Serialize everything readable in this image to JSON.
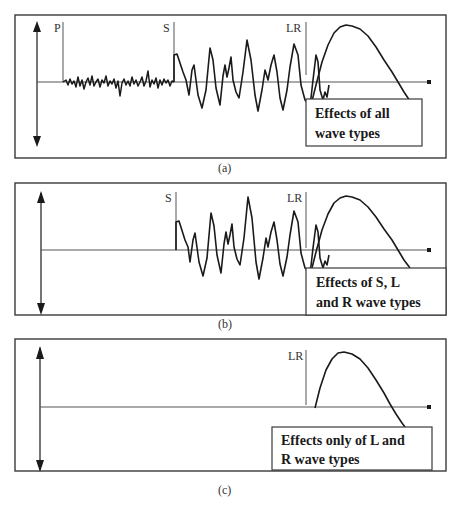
{
  "panels": [
    {
      "id": "a",
      "caption": "(a)",
      "markers": [
        "P",
        "S",
        "LR"
      ],
      "description_line1": "Effects of all",
      "description_line2": "wave types"
    },
    {
      "id": "b",
      "caption": "(b)",
      "markers": [
        "S",
        "LR"
      ],
      "description_line1": "Effects of S, L",
      "description_line2": "and R wave types"
    },
    {
      "id": "c",
      "caption": "(c)",
      "markers": [
        "LR"
      ],
      "description_line1": "Effects only of  L and",
      "description_line2": "R wave types"
    }
  ],
  "colors": {
    "line": "#1a1a1a",
    "frame": "#3a3a3a",
    "background": "#ffffff"
  }
}
